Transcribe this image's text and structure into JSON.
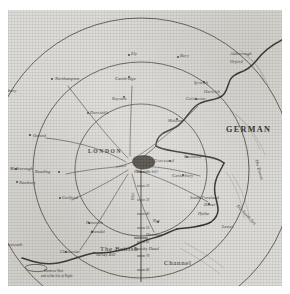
{
  "map": {
    "title": "Map of the country round London with concentric distance circles",
    "center_city": "LONDON",
    "paper_color": "#d9d8d4",
    "ink_color": "#2b2721",
    "frame_color": "#ffffff",
    "scale_caption": "Miles",
    "sea_labels": [
      {
        "name": "german-ocean",
        "text": "GERMAN",
        "x": 218,
        "y": 122,
        "rotate": 0
      },
      {
        "name": "british-channel-1",
        "text": "The British",
        "x": 92,
        "y": 239,
        "rotate": 0
      },
      {
        "name": "british-channel-2",
        "text": "Channel",
        "x": 158,
        "y": 253,
        "rotate": 0
      },
      {
        "name": "the-downs",
        "text": "The Downs",
        "x": 247,
        "y": 150,
        "rotate": 74
      },
      {
        "name": "the-north-sea",
        "text": "The North Sea",
        "x": 232,
        "y": 196,
        "rotate": 46
      }
    ],
    "towns": [
      {
        "name": "northampton",
        "label": "Northampton",
        "x": 47,
        "y": 70,
        "dot": true
      },
      {
        "name": "banbury",
        "label": "Banbury",
        "x": 10,
        "y": 80,
        "dot": false
      },
      {
        "name": "oxford",
        "label": "Oxford",
        "x": 25,
        "y": 126,
        "dot": true
      },
      {
        "name": "marlborough",
        "label": "Malborough",
        "x": 9,
        "y": 160,
        "dot": true
      },
      {
        "name": "newbury",
        "label": "Newbury",
        "x": 10,
        "y": 173,
        "dot": true
      },
      {
        "name": "reading",
        "label": "Reading",
        "x": 54,
        "y": 163,
        "dot": true
      },
      {
        "name": "guildford",
        "label": "Guilford",
        "x": 54,
        "y": 189,
        "dot": true
      },
      {
        "name": "dunstable",
        "label": "Dunstable",
        "x": 82,
        "y": 104,
        "dot": true
      },
      {
        "name": "ely",
        "label": "Ely",
        "x": 124,
        "y": 46,
        "dot": true
      },
      {
        "name": "bury",
        "label": "Bury",
        "x": 172,
        "y": 48,
        "dot": true
      },
      {
        "name": "cambridge",
        "label": "Cambridge",
        "x": 124,
        "y": 68,
        "dot": true
      },
      {
        "name": "royston",
        "label": "Royston",
        "x": 119,
        "y": 88,
        "dot": true
      },
      {
        "name": "ipswich",
        "label": "Ipswich",
        "x": 198,
        "y": 73,
        "dot": true
      },
      {
        "name": "aldborough",
        "label": "Aldborough",
        "x": 236,
        "y": 48,
        "dot": true
      },
      {
        "name": "orford",
        "label": "Orford",
        "x": 234,
        "y": 58,
        "dot": true
      },
      {
        "name": "harwich",
        "label": "Harwich",
        "x": 208,
        "y": 83,
        "dot": true
      },
      {
        "name": "colchester",
        "label": "Colchester",
        "x": 191,
        "y": 90,
        "dot": true
      },
      {
        "name": "maldon",
        "label": "Maldon",
        "x": 171,
        "y": 110,
        "dot": true
      },
      {
        "name": "gravesend",
        "label": "Gravesend",
        "x": 164,
        "y": 152,
        "dot": true
      },
      {
        "name": "shooters-hill",
        "label": "Shooters hill",
        "x": 135,
        "y": 163,
        "dot": true
      },
      {
        "name": "rochester",
        "label": "Rochester",
        "x": 181,
        "y": 148,
        "dot": true
      },
      {
        "name": "canterbury",
        "label": "Canterbury",
        "x": 177,
        "y": 166,
        "dot": true
      },
      {
        "name": "south-foreland",
        "label": "South Foreland",
        "x": 199,
        "y": 188,
        "dot": true
      },
      {
        "name": "dover",
        "label": "Dover",
        "x": 203,
        "y": 195,
        "dot": true
      },
      {
        "name": "hythe",
        "label": "Hythe",
        "x": 194,
        "y": 204,
        "dot": true
      },
      {
        "name": "rye",
        "label": "Rye",
        "x": 152,
        "y": 213,
        "dot": true
      },
      {
        "name": "hastings",
        "label": "Hastings",
        "x": 145,
        "y": 224,
        "dot": true
      },
      {
        "name": "beachy-head",
        "label": "Beachy Head",
        "x": 134,
        "y": 237,
        "dot": true
      },
      {
        "name": "lewes",
        "label": "Lewes",
        "x": 216,
        "y": 218,
        "dot": false
      },
      {
        "name": "petworth",
        "label": "Petworth",
        "x": 83,
        "y": 214,
        "dot": true
      },
      {
        "name": "arundel",
        "label": "Arundel",
        "x": 86,
        "y": 223,
        "dot": true
      },
      {
        "name": "portsmouth",
        "label": "Portsmouth",
        "x": 8,
        "y": 235,
        "dot": false
      },
      {
        "name": "chichester",
        "label": "Chichester",
        "x": 60,
        "y": 243,
        "dot": true
      },
      {
        "name": "selsey-bill",
        "label": "Selsey Bill",
        "x": 93,
        "y": 246,
        "dot": true
      },
      {
        "name": "dunnose",
        "label": "Dunnose West",
        "x": 38,
        "y": 262,
        "dot": true
      },
      {
        "name": "isle-of-wight",
        "label": "end of the Isle of Wight",
        "x": 36,
        "y": 267,
        "dot": false
      }
    ],
    "scale_ticks": [
      "10",
      "20",
      "30",
      "40",
      "50",
      "60",
      "70",
      "80"
    ],
    "rings": [
      {
        "name": "inner-distance-circle",
        "cx": 133,
        "cy": 160,
        "r": 66
      },
      {
        "name": "middle-distance-circle",
        "cx": 133,
        "cy": 160,
        "r": 108
      },
      {
        "name": "outer-distance-circle",
        "cx": 133,
        "cy": 160,
        "r": 152
      }
    ]
  }
}
